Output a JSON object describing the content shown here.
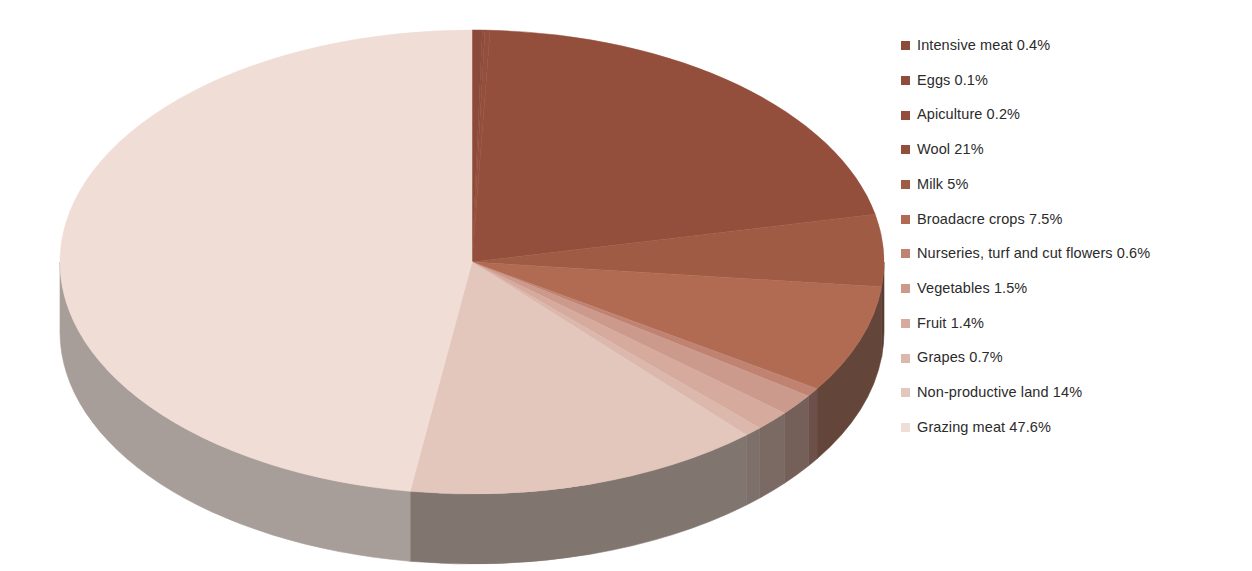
{
  "chart_data": {
    "type": "pie",
    "title": "",
    "subtitle": "",
    "xlabel": "",
    "ylabel": "",
    "legend_position": "right",
    "three_d": true,
    "start_angle_deg": 0,
    "direction": "clockwise",
    "units": "percent",
    "categories": [
      "Intensive meat",
      "Eggs",
      "Apiculture",
      "Wool",
      "Milk",
      "Broadacre crops",
      "Nurseries, turf and cut flowers",
      "Vegetables",
      "Fruit",
      "Grapes",
      "Non-productive land",
      "Grazing meat"
    ],
    "values": [
      0.4,
      0.1,
      0.2,
      21,
      5,
      7.5,
      0.6,
      1.5,
      1.4,
      0.7,
      14,
      47.6
    ],
    "value_labels": [
      "0.4%",
      "0.1%",
      "0.2%",
      "21%",
      "5%",
      "7.5%",
      "0.6%",
      "1.5%",
      "1.4%",
      "0.7%",
      "14%",
      "47.6%"
    ],
    "colors": [
      "#8c4a3b",
      "#8f4c3c",
      "#944f3c",
      "#944f3c",
      "#a05b45",
      "#b06b52",
      "#c08372",
      "#cc9a8c",
      "#d6aa9d",
      "#dcb8ac",
      "#e3c6bc",
      "#f0ddd6"
    ],
    "side_colors": [
      "#5a382d",
      "#5a382d",
      "#5a382d",
      "#52332b",
      "#5a3c31",
      "#63453a",
      "#6d5049",
      "#756059",
      "#7a6a63",
      "#7d6f69",
      "#81756f",
      "#a89e99"
    ]
  },
  "legend": {
    "items": [
      {
        "label": "Intensive meat 0.4%",
        "color": "#8c4a3b"
      },
      {
        "label": "Eggs 0.1%",
        "color": "#8f4c3c"
      },
      {
        "label": "Apiculture 0.2%",
        "color": "#944f3c"
      },
      {
        "label": "Wool 21%",
        "color": "#944f3c"
      },
      {
        "label": "Milk 5%",
        "color": "#a05b45"
      },
      {
        "label": "Broadacre crops 7.5%",
        "color": "#b06b52"
      },
      {
        "label": "Nurseries, turf and cut flowers 0.6%",
        "color": "#c08372"
      },
      {
        "label": "Vegetables 1.5%",
        "color": "#cc9a8c"
      },
      {
        "label": "Fruit 1.4%",
        "color": "#d6aa9d"
      },
      {
        "label": "Grapes 0.7%",
        "color": "#dcb8ac"
      },
      {
        "label": "Non-productive land 14%",
        "color": "#e3c6bc"
      },
      {
        "label": "Grazing meat 47.6%",
        "color": "#f0ddd6"
      }
    ]
  },
  "geometry": {
    "cx": 472,
    "cy": 262,
    "rx": 412,
    "ry": 232,
    "depth": 70
  }
}
